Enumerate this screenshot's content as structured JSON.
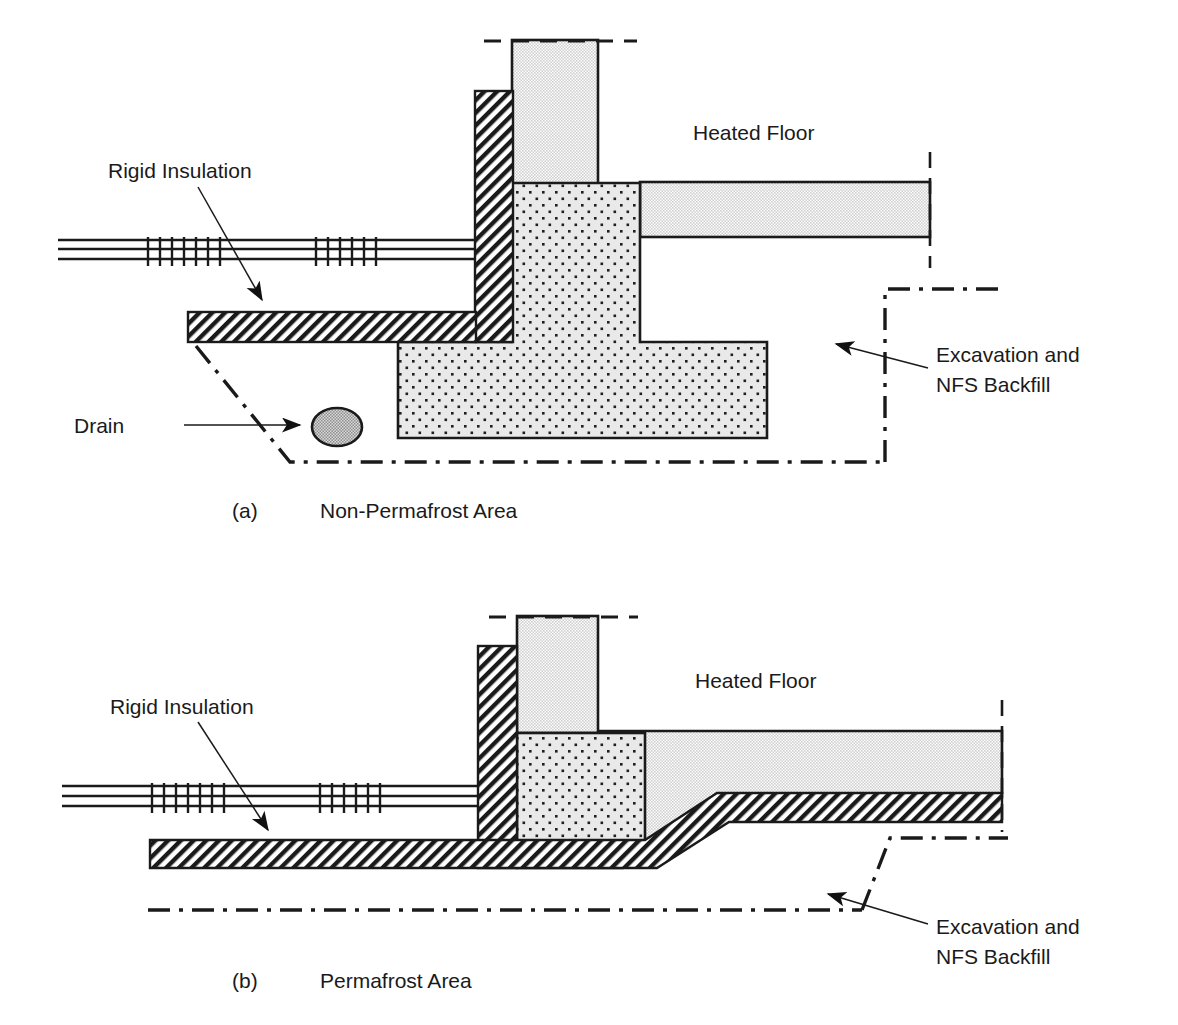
{
  "figure": {
    "title_visible": false,
    "background_color": "#ffffff",
    "line_color": "#1a1a1a",
    "concrete_fill": "#e2e2e2",
    "nfs_fill": "#e6e6e6",
    "insulation_fill": "#ffffff",
    "drain_fill": "#b8b8b8"
  },
  "panels": [
    {
      "id": "a",
      "caption_index": "(a)",
      "caption_title": "Non-Permafrost Area",
      "labels": {
        "rigid_insulation": "Rigid Insulation",
        "drain": "Drain",
        "heated_floor": "Heated Floor",
        "excavation_line1": "Excavation and",
        "excavation_line2": "NFS Backfill"
      },
      "elements": [
        "grade-line",
        "foundation-wall",
        "exterior-rigid-insulation",
        "horizontal-rigid-insulation",
        "perimeter-drain",
        "nfs-backfill-footing",
        "heated-floor-slab",
        "excavation-limit-line"
      ]
    },
    {
      "id": "b",
      "caption_index": "(b)",
      "caption_title": "Permafrost Area",
      "labels": {
        "rigid_insulation": "Rigid Insulation",
        "heated_floor": "Heated Floor",
        "excavation_line1": "Excavation and",
        "excavation_line2": "NFS Backfill"
      },
      "elements": [
        "grade-line",
        "foundation-wall",
        "exterior-rigid-insulation",
        "horizontal-rigid-insulation",
        "sloped-rigid-insulation",
        "nfs-backfill",
        "heated-floor-slab",
        "excavation-limit-line"
      ]
    }
  ]
}
